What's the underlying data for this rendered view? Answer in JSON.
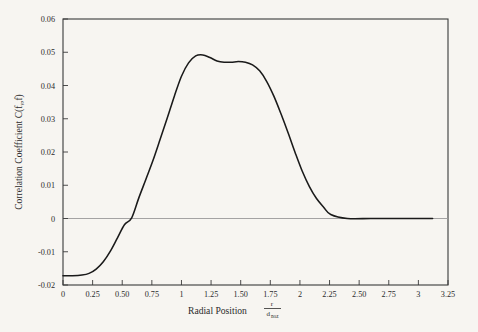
{
  "figure": {
    "background_color": "#f7f5f1",
    "frame_color": "#3a3a3a",
    "curve_color": "#1a1a1a",
    "zero_line_color": "#9a9a9a"
  },
  "chart_data": {
    "type": "line",
    "title": "",
    "xlabel": "Radial Position",
    "xlabel_numerator": "r",
    "xlabel_denominator": "d",
    "xlabel_denominator_sub": "noz",
    "ylabel": "Correlation Coefficient C(",
    "ylabel_sub_var": "f",
    "ylabel_sub_sub": "v",
    "ylabel_tail": ",f)",
    "ylabel_full": "Correlation Coefficient C(f_v,f)",
    "xlim": [
      0,
      3.25
    ],
    "ylim": [
      -0.02,
      0.06
    ],
    "grid": false,
    "legend": null,
    "x_ticks": [
      0,
      0.25,
      0.5,
      0.75,
      1,
      1.25,
      1.5,
      1.75,
      2,
      2.25,
      2.5,
      2.75,
      3,
      3.25
    ],
    "x_tick_labels": [
      "0",
      "0.25",
      "0.50",
      "0.75",
      "1",
      "1.25",
      "1.50",
      "1.75",
      "2",
      "2.25",
      "2.50",
      "2.75",
      "3",
      "3.25"
    ],
    "y_ticks": [
      -0.02,
      -0.01,
      0,
      0.01,
      0.02,
      0.03,
      0.04,
      0.05,
      0.06
    ],
    "y_tick_labels": [
      "-0.02",
      "-0.01",
      "0",
      "0.01",
      "0.02",
      "0.03",
      "0.04",
      "0.05",
      "0.06"
    ],
    "zero_reference_line": 0,
    "series": [
      {
        "name": "C(fv,f)",
        "x": [
          0.0,
          0.08,
          0.16,
          0.22,
          0.28,
          0.34,
          0.4,
          0.46,
          0.52,
          0.58,
          0.64,
          0.7,
          0.76,
          0.82,
          0.88,
          0.94,
          1.0,
          1.06,
          1.12,
          1.18,
          1.24,
          1.3,
          1.36,
          1.42,
          1.48,
          1.54,
          1.6,
          1.66,
          1.72,
          1.78,
          1.84,
          1.9,
          1.96,
          2.02,
          2.08,
          2.14,
          2.2,
          2.26,
          2.4,
          2.6,
          2.8,
          3.0,
          3.12
        ],
        "y": [
          -0.0172,
          -0.0172,
          -0.017,
          -0.0165,
          -0.0152,
          -0.013,
          -0.0098,
          -0.0058,
          -0.0018,
          0.0002,
          0.0062,
          0.0118,
          0.0175,
          0.0238,
          0.0302,
          0.0368,
          0.0428,
          0.0468,
          0.0489,
          0.0492,
          0.0484,
          0.0474,
          0.047,
          0.047,
          0.0472,
          0.047,
          0.0462,
          0.0444,
          0.0412,
          0.0368,
          0.0315,
          0.0258,
          0.0198,
          0.0142,
          0.0096,
          0.006,
          0.0034,
          0.0012,
          0.0,
          0.0,
          0.0,
          0.0,
          0.0
        ]
      }
    ]
  }
}
